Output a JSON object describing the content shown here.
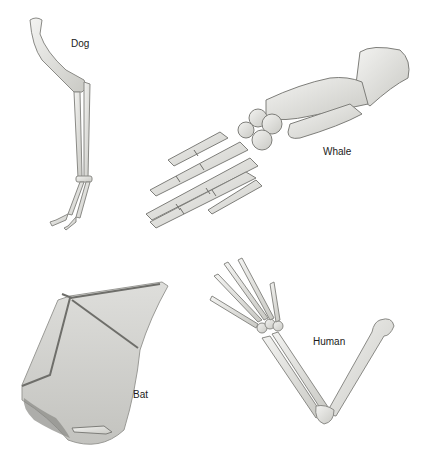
{
  "figure": {
    "labels": {
      "dog": "Dog",
      "whale": "Whale",
      "bat": "Bat",
      "human": "Human"
    },
    "colors": {
      "background": "#ffffff",
      "bone_fill": "#e9e9e6",
      "bone_stroke": "#8a8a86",
      "bone_shadow": "#bdbdb8",
      "wing_membrane": "#cfcfcb",
      "text": "#1a1a1a"
    }
  }
}
